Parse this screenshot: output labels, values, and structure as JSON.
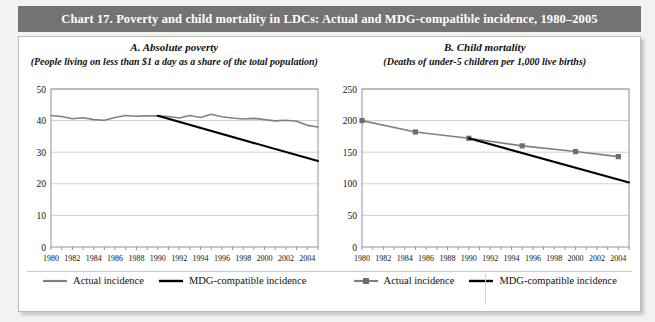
{
  "header": {
    "title": "Chart 17.  Poverty and child mortality in LDCs: Actual and MDG-compatible incidence, 1980–2005"
  },
  "colors": {
    "title_bar": "#737373",
    "actual_line": "#808080",
    "mdg_line": "#000000",
    "grid": "#c9c9c9",
    "axis": "#888888",
    "page_bg": "#f2f2f0",
    "panel_bg": "#ffffff"
  },
  "legend": {
    "left": [
      {
        "label": "Actual incidence",
        "style": "line",
        "color": "#808080",
        "marker": false
      },
      {
        "label": "MDG-compatible incidence",
        "style": "line",
        "color": "#000000",
        "marker": false
      }
    ],
    "right": [
      {
        "label": "Actual incidence",
        "style": "line",
        "color": "#808080",
        "marker": true
      },
      {
        "label": "MDG-compatible incidence",
        "style": "line",
        "color": "#000000",
        "marker": false
      }
    ]
  },
  "chart_data": [
    {
      "type": "line",
      "panel": "A",
      "title": "A. Absolute poverty",
      "subtitle": "(People living on less than $1 a day as a share of the total population)",
      "xlabel": "",
      "ylabel": "",
      "xlim": [
        1980,
        2005
      ],
      "ylim": [
        0,
        50
      ],
      "yticks": [
        0,
        10,
        20,
        30,
        40,
        50
      ],
      "xticks": [
        1980,
        1981,
        1982,
        1983,
        1984,
        1985,
        1986,
        1987,
        1988,
        1989,
        1990,
        1991,
        1992,
        1993,
        1994,
        1995,
        1996,
        1997,
        1998,
        1999,
        2000,
        2001,
        2002,
        2003,
        2004,
        2005
      ],
      "xticklabels": [
        "1980",
        "1982",
        "1984",
        "1986",
        "1988",
        "1990",
        "1992",
        "1994",
        "1996",
        "1998",
        "2000",
        "2002",
        "2004"
      ],
      "xticklabel_years": [
        1980,
        1982,
        1984,
        1986,
        1988,
        1990,
        1992,
        1994,
        1996,
        1998,
        2000,
        2002,
        2004
      ],
      "grid": true,
      "grid_axis": "y",
      "legend_position": "below",
      "series": [
        {
          "name": "Actual incidence",
          "color": "#808080",
          "marker": false,
          "x": [
            1980,
            1981,
            1982,
            1983,
            1984,
            1985,
            1986,
            1987,
            1988,
            1989,
            1990,
            1991,
            1992,
            1993,
            1994,
            1995,
            1996,
            1997,
            1998,
            1999,
            2000,
            2001,
            2002,
            2003,
            2004,
            2005
          ],
          "values": [
            41.6,
            41.3,
            40.6,
            40.9,
            40.3,
            40.1,
            41.0,
            41.6,
            41.4,
            41.5,
            41.5,
            41.3,
            40.8,
            41.6,
            41.0,
            42.0,
            41.2,
            40.8,
            40.5,
            40.7,
            40.3,
            39.9,
            40.1,
            39.8,
            38.5,
            38.0
          ]
        },
        {
          "name": "MDG-compatible incidence",
          "color": "#000000",
          "marker": false,
          "x": [
            1990,
            2005
          ],
          "values": [
            41.5,
            27.2
          ]
        }
      ]
    },
    {
      "type": "line",
      "panel": "B",
      "title": "B. Child mortality",
      "subtitle": "(Deaths of under-5 children per 1,000 live births)",
      "xlabel": "",
      "ylabel": "",
      "xlim": [
        1980,
        2005
      ],
      "ylim": [
        0,
        250
      ],
      "yticks": [
        0,
        50,
        100,
        150,
        200,
        250
      ],
      "xticks": [
        1980,
        1981,
        1982,
        1983,
        1984,
        1985,
        1986,
        1987,
        1988,
        1989,
        1990,
        1991,
        1992,
        1993,
        1994,
        1995,
        1996,
        1997,
        1998,
        1999,
        2000,
        2001,
        2002,
        2003,
        2004,
        2005
      ],
      "xticklabels": [
        "1980",
        "1982",
        "1984",
        "1986",
        "1988",
        "1990",
        "1992",
        "1994",
        "1996",
        "1998",
        "2000",
        "2002",
        "2004"
      ],
      "xticklabel_years": [
        1980,
        1982,
        1984,
        1986,
        1988,
        1990,
        1992,
        1994,
        1996,
        1998,
        2000,
        2002,
        2004
      ],
      "grid": true,
      "grid_axis": "y",
      "legend_position": "below",
      "series": [
        {
          "name": "Actual incidence",
          "color": "#808080",
          "marker": true,
          "x": [
            1980,
            1985,
            1990,
            1995,
            2000,
            2004
          ],
          "values": [
            200,
            182,
            172,
            160,
            151,
            143
          ]
        },
        {
          "name": "MDG-compatible incidence",
          "color": "#000000",
          "marker": false,
          "x": [
            1990,
            2005
          ],
          "values": [
            172,
            102
          ]
        }
      ]
    }
  ]
}
